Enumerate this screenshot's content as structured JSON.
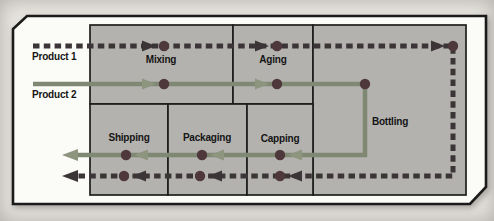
{
  "diagram": {
    "labels": {
      "product1": "Product 1",
      "product2": "Product 2",
      "mixing": "Mixing",
      "aging": "Aging",
      "bottling": "Bottling",
      "shipping": "Shipping",
      "packaging": "Packaging",
      "capping": "Capping"
    },
    "products": [
      {
        "name": "Product 1",
        "line_style": "dashed"
      },
      {
        "name": "Product 2",
        "line_style": "solid"
      }
    ],
    "flow_order": [
      "Mixing",
      "Aging",
      "Bottling",
      "Capping",
      "Packaging",
      "Shipping"
    ]
  },
  "colors": {
    "page_bg": "#e8e6e2",
    "frame_fill": "#fbfbf8",
    "box_fill": "#b3b2af",
    "p1": "#3b3537",
    "p2": "#7f8873",
    "p2_arrow": "#8d957f",
    "dot": "#4e383b",
    "ink": "#151515"
  }
}
